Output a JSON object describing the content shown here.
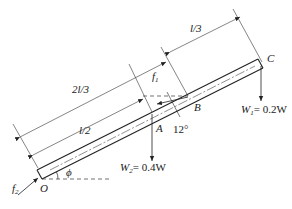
{
  "diagram": {
    "type": "free-body diagram of inclined beam",
    "points": {
      "O": "O",
      "A": "A",
      "B": "B",
      "C": "C"
    },
    "dimensions": {
      "l_third": "l/3",
      "two_l_third": "2l/3",
      "l_half": "l/2"
    },
    "forces": {
      "f1": "f",
      "f1_sub": "1",
      "f2": "f",
      "f2_sub": "2",
      "W1": "W",
      "W1_sub": "1",
      "W1_value": "= 0.2W",
      "W2": "W",
      "W2_sub": "2",
      "W2_value": "= 0.4W"
    },
    "angles": {
      "phi": "ϕ",
      "b_angle": "12°"
    },
    "colors": {
      "line": "#222222",
      "background": "#ffffff"
    }
  }
}
